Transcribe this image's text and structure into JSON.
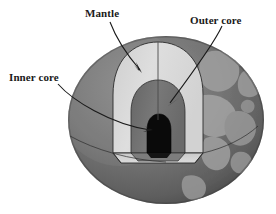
{
  "figure": {
    "background_color": "#ffffff"
  },
  "labels": {
    "mantle": "Mantle",
    "outer_core": "Outer core",
    "inner_core": "Inner core"
  },
  "colors": {
    "ocean": "#6e6e6e",
    "ocean_shadow": "#4f4f4f",
    "land": "#a6a6a6",
    "mantle": "#d9d9d9",
    "outer_core": "#707070",
    "outer_core_wall": "#5c5c5c",
    "inner_core": "#0a0a0a",
    "outline": "#2b2b2b",
    "label_text": "#1a1a1a",
    "leader_line": "#1a1a1a"
  },
  "diagram": {
    "type": "cutaway-cross-section",
    "layers": [
      {
        "name": "mantle",
        "label": "Mantle",
        "order": 1,
        "fill": "#d9d9d9"
      },
      {
        "name": "outer-core",
        "label": "Outer core",
        "order": 2,
        "fill": "#707070"
      },
      {
        "name": "inner-core",
        "label": "Inner core",
        "order": 3,
        "fill": "#0a0a0a"
      }
    ],
    "globe": {
      "cx": 166,
      "cy": 120,
      "rx": 98,
      "ry": 84
    },
    "annotations": [
      {
        "name": "mantle",
        "label": "Mantle",
        "arrow_tip_x": 142,
        "arrow_tip_y": 72
      },
      {
        "name": "outer-core",
        "label": "Outer core",
        "arrow_tip_x": 168,
        "arrow_tip_y": 105
      },
      {
        "name": "inner-core",
        "label": "Inner core",
        "arrow_tip_x": 152,
        "arrow_tip_y": 130
      }
    ]
  }
}
